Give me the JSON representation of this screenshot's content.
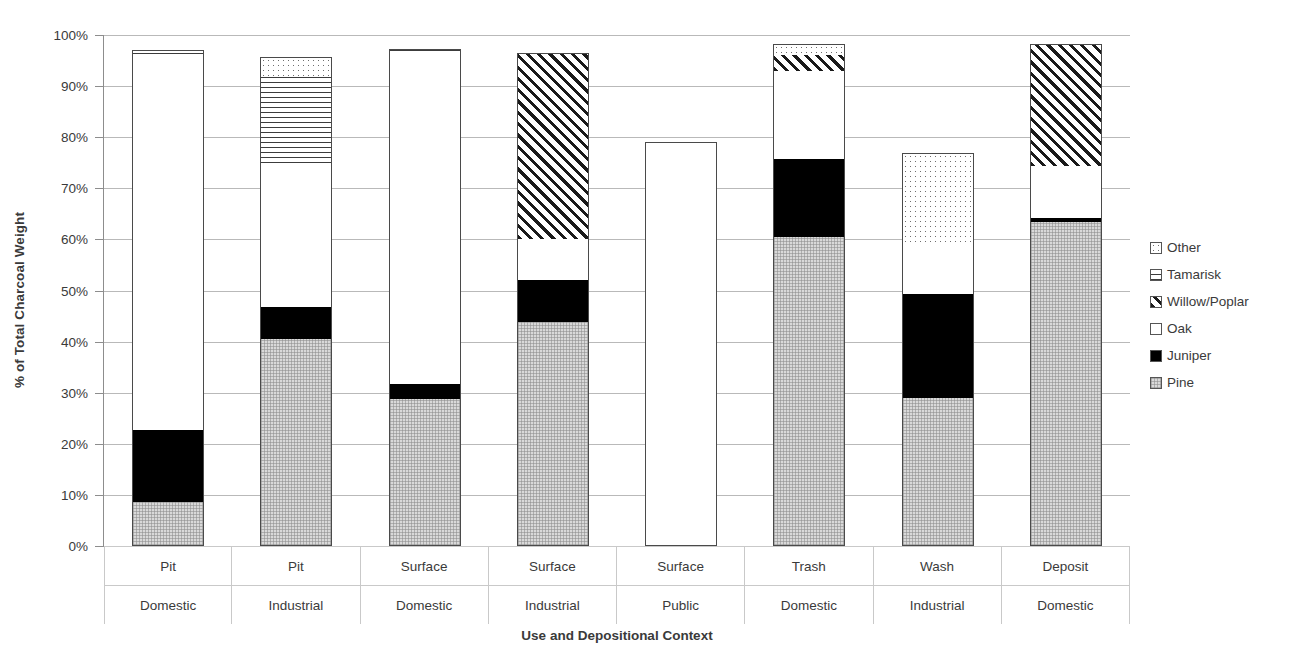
{
  "chart_data": {
    "type": "bar",
    "subtype": "stacked-bar-100-percent",
    "title": "",
    "xlabel": "Use and Depositional Context",
    "ylabel": "% of Total Charcoal Weight",
    "ylim": [
      0,
      100
    ],
    "ytick_labels": [
      "100%",
      "90%",
      "80%",
      "70%",
      "60%",
      "50%",
      "40%",
      "30%",
      "20%",
      "10%",
      "0%"
    ],
    "ytick_values": [
      100,
      90,
      80,
      70,
      60,
      50,
      40,
      30,
      20,
      10,
      0
    ],
    "grid": true,
    "legend_position": "right",
    "categories": [
      "Pit / Domestic",
      "Pit / Industrial",
      "Surface / Domestic",
      "Surface / Industrial",
      "Surface / Public",
      "Trash / Domestic",
      "Wash / Industrial",
      "Deposit / Domestic"
    ],
    "category_lines": [
      {
        "line1": "Pit",
        "line2": "Domestic"
      },
      {
        "line1": "Pit",
        "line2": "Industrial"
      },
      {
        "line1": "Surface",
        "line2": "Domestic"
      },
      {
        "line1": "Surface",
        "line2": "Industrial"
      },
      {
        "line1": "Surface",
        "line2": "Public"
      },
      {
        "line1": "Trash",
        "line2": "Domestic"
      },
      {
        "line1": "Wash",
        "line2": "Industrial"
      },
      {
        "line1": "Deposit",
        "line2": "Domestic"
      }
    ],
    "series": [
      {
        "name": "Pine",
        "pattern": "light-gray-fine-grid",
        "values": [
          8.7,
          40.5,
          28.8,
          43.9,
          0.0,
          60.5,
          28.9,
          63.5
        ]
      },
      {
        "name": "Juniper",
        "pattern": "solid-black",
        "values": [
          14.0,
          6.3,
          3.0,
          8.2,
          0.0,
          15.2,
          20.5,
          0.6
        ]
      },
      {
        "name": "Oak",
        "pattern": "white",
        "values": [
          73.6,
          28.2,
          65.0,
          8.0,
          79.1,
          17.3,
          9.6,
          10.2
        ]
      },
      {
        "name": "Willow/Poplar",
        "pattern": "diagonal-hatch",
        "values": [
          0.0,
          0.0,
          0.0,
          36.3,
          0.0,
          3.1,
          0.0,
          23.9
        ]
      },
      {
        "name": "Tamarisk",
        "pattern": "horizontal-lines",
        "values": [
          0.3,
          17.0,
          0.2,
          0.0,
          0.0,
          0.0,
          0.0,
          0.0
        ]
      },
      {
        "name": "Other",
        "pattern": "dotted",
        "values": [
          0.4,
          3.7,
          0.2,
          0.0,
          0.0,
          2.1,
          18.0,
          0.0
        ]
      }
    ],
    "bar_totals": [
      97.0,
      95.7,
      97.2,
      96.4,
      79.1,
      98.2,
      77.0,
      98.2
    ],
    "stack_order_bottom_to_top": [
      "Pine",
      "Juniper",
      "Oak",
      "Willow/Poplar",
      "Tamarisk",
      "Other"
    ]
  },
  "legend": {
    "items": [
      {
        "label": "Other",
        "swatch": "dotted-swatch"
      },
      {
        "label": "Tamarisk",
        "swatch": "horizontal-lines-swatch"
      },
      {
        "label": "Willow/Poplar",
        "swatch": "diagonal-hatch-swatch"
      },
      {
        "label": "Oak",
        "swatch": "white-swatch"
      },
      {
        "label": "Juniper",
        "swatch": "solid-black-swatch"
      },
      {
        "label": "Pine",
        "swatch": "light-gray-swatch"
      }
    ]
  },
  "colors": {
    "gridline": "#b9b9b9",
    "axis": "#8d8d8d",
    "text": "#3a3a3a",
    "pine": "#d9d9d9",
    "juniper": "#000000",
    "oak": "#ffffff",
    "outline": "#4a4a4a"
  }
}
